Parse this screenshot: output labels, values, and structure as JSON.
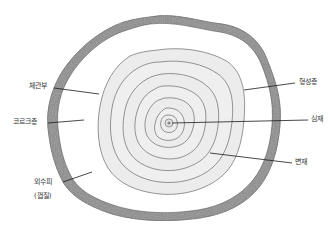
{
  "diagram": {
    "labels": {
      "phloem": "체관부",
      "cork": "코르크층",
      "outer_bark": "외수피",
      "outer_bark_sub": "(껍질)",
      "cambium": "형성층",
      "pith": "심재",
      "sapwood": "변재"
    },
    "colors": {
      "bark": "#8c8c8c",
      "bark_dark": "#6e6e6e",
      "phloem_fill": "#ffffff",
      "wood_fill": "#ececec",
      "ring_line": "#7a7a7a",
      "leader_line": "#1a1a1a",
      "text": "#333333"
    },
    "ring_count": 7
  }
}
